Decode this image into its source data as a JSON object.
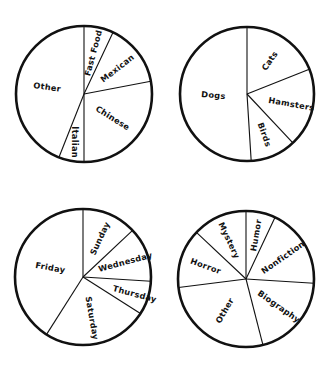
{
  "chart_data": [
    {
      "type": "pie",
      "title": "",
      "start": "top",
      "direction": "clockwise",
      "slices": [
        {
          "label": "Fast Food",
          "value": 7
        },
        {
          "label": "Mexican",
          "value": 15
        },
        {
          "label": "Chinese",
          "value": 28
        },
        {
          "label": "Italian",
          "value": 6
        },
        {
          "label": "Other",
          "value": 44
        }
      ]
    },
    {
      "type": "pie",
      "title": "",
      "start": "top",
      "direction": "clockwise",
      "slices": [
        {
          "label": "Cats",
          "value": 19
        },
        {
          "label": "Hamsters",
          "value": 19
        },
        {
          "label": "Birds",
          "value": 11
        },
        {
          "label": "Dogs",
          "value": 51
        }
      ]
    },
    {
      "type": "pie",
      "title": "",
      "start": "top",
      "direction": "clockwise",
      "slices": [
        {
          "label": "Sunday",
          "value": 13
        },
        {
          "label": "Wednesday",
          "value": 13
        },
        {
          "label": "Thursday",
          "value": 8
        },
        {
          "label": "Saturday",
          "value": 25
        },
        {
          "label": "Friday",
          "value": 41
        }
      ]
    },
    {
      "type": "pie",
      "title": "",
      "start": "top",
      "direction": "clockwise",
      "slices": [
        {
          "label": "Humor",
          "value": 7
        },
        {
          "label": "Nonfiction",
          "value": 19
        },
        {
          "label": "Biography",
          "value": 20
        },
        {
          "label": "Other",
          "value": 27
        },
        {
          "label": "Horror",
          "value": 14
        },
        {
          "label": "Mystery",
          "value": 13
        }
      ]
    }
  ],
  "colors": {
    "stroke": "#111111",
    "fill": "#ffffff",
    "text": "#111111"
  }
}
